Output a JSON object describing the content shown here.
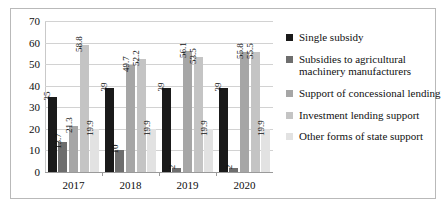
{
  "chart_data": {
    "type": "bar",
    "title": "",
    "xlabel": "",
    "ylabel": "",
    "ylim": [
      0,
      70
    ],
    "yticks": [
      0,
      10,
      20,
      30,
      40,
      50,
      60,
      70
    ],
    "grid": true,
    "legend_position": "right",
    "categories": [
      "2017",
      "2018",
      "2019",
      "2020"
    ],
    "series": [
      {
        "name": "Single subsidy",
        "color": "#1a1a1a",
        "values": [
          35,
          39,
          39,
          39
        ],
        "labels": [
          "35",
          "39",
          "39",
          "39"
        ]
      },
      {
        "name": "Subsidies to agricultural machinery manufacturers",
        "color": "#6e6e6e",
        "values": [
          13.7,
          10,
          2,
          2
        ],
        "labels": [
          "13.7",
          "10",
          "2",
          "2"
        ]
      },
      {
        "name": "Support of concessional lending",
        "color": "#a6a6a6",
        "values": [
          21.3,
          49.7,
          56.1,
          55.8
        ],
        "labels": [
          "21.3",
          "49.7",
          "56.1",
          "55.8"
        ]
      },
      {
        "name": "Investment lending support",
        "color": "#c4c4c4",
        "values": [
          58.8,
          52.2,
          53.5,
          55.5
        ],
        "labels": [
          "58.8",
          "52.2",
          "53.5",
          "55.5"
        ]
      },
      {
        "name": "Other forms of state support",
        "color": "#e2e2e2",
        "values": [
          19.9,
          19.9,
          19.9,
          19.9
        ],
        "labels": [
          "19.9",
          "19.9",
          "19.9",
          "19.9"
        ]
      }
    ]
  }
}
